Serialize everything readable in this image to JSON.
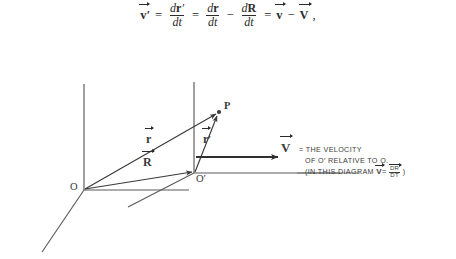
{
  "equation": {
    "lhs": "v",
    "lhs_prime": "′",
    "eq1": "=",
    "t1_num_base": "d",
    "t1_num_vec": "r",
    "t1_num_prime": "′",
    "t1_den": "dt",
    "eq2": "=",
    "t2_num_base": "d",
    "t2_num_vec": "r",
    "t2_den": "dt",
    "minus": "−",
    "t3_num_base": "d",
    "t3_num_vec": "R",
    "t3_den": "dt",
    "eq3": "=",
    "rhs1": "v",
    "minus2": "−",
    "rhs2": "V",
    "comma": ","
  },
  "diagram": {
    "origin_o": "O",
    "origin_o_prime": "O′",
    "point_p": "P",
    "vector_r": "r",
    "vector_r_prime": "r",
    "vector_r_prime_mark": "′",
    "vector_R": "R",
    "vector_V": "V",
    "annotation": {
      "line1": "= The velocity",
      "line2": "of O′ Relative to O.",
      "line3_a": "(in this diagram",
      "line3_v": "V",
      "line3_eq": "=",
      "line3_num": "dR",
      "line3_den": "dt",
      "line3_close": ")"
    }
  },
  "colors": {
    "ink": "#3a3a3a",
    "equation_ink": "#2b2b2b",
    "background": "#ffffff"
  }
}
